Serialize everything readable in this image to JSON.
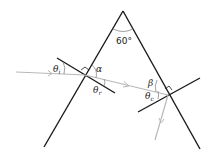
{
  "diagram": {
    "apex_angle_label": "60°",
    "labels": {
      "theta_i": "θ",
      "theta_i_sub": "i",
      "alpha": "α",
      "theta_r": "θ",
      "theta_r_sub": "r",
      "beta": "β",
      "theta_c": "θ",
      "theta_c_sub": "c"
    },
    "colors": {
      "prism": "#1a1a1a",
      "normal": "#1a1a1a",
      "ray": "#b8b8b8",
      "angle_arc": "#888888"
    }
  }
}
